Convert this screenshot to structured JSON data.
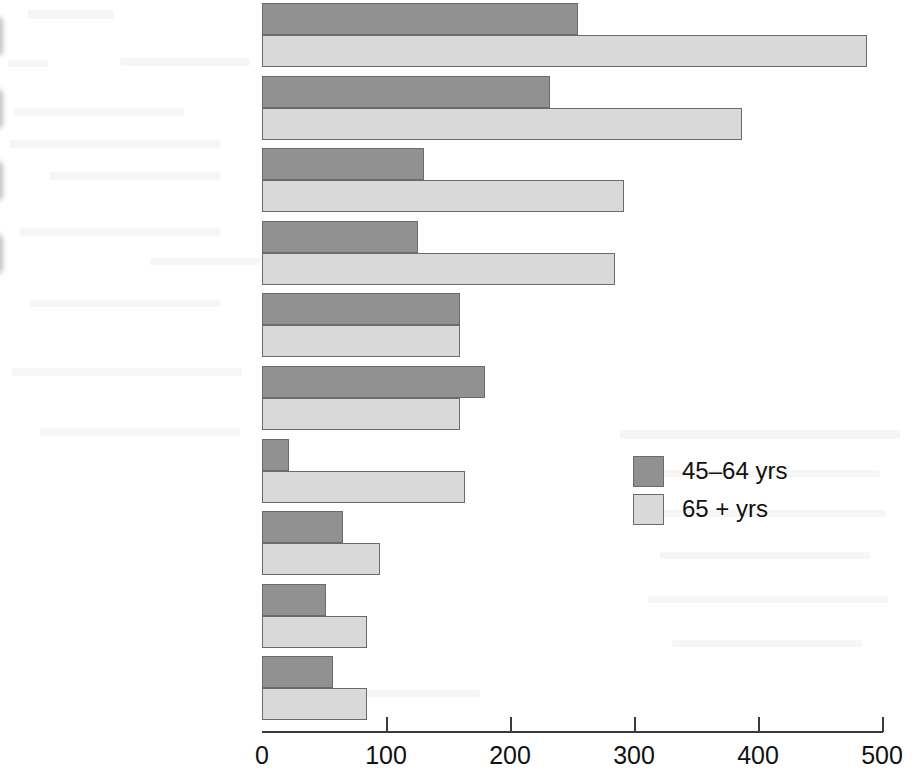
{
  "chart_data": {
    "type": "bar",
    "orientation": "horizontal",
    "title": "",
    "xlabel": "",
    "ylabel": "",
    "xlim": [
      0,
      500
    ],
    "xticks": [
      0,
      100,
      200,
      300,
      400,
      500
    ],
    "xtick_labels": [
      "0",
      "100",
      "200",
      "300",
      "400",
      "500"
    ],
    "grid": false,
    "legend_position": "center-right",
    "categories": [
      "Arthritis",
      "Hypertension",
      "Hearing impairment",
      "Heart disease",
      "Orthopedic impairment",
      "Sinusitis",
      "Cataracts",
      "Diabetes",
      "Visual impairment",
      "Tinnitus"
    ],
    "series": [
      {
        "name": "45–64 yrs",
        "color": "#919191",
        "values": [
          255,
          232,
          131,
          126,
          160,
          180,
          22,
          65,
          52,
          57
        ]
      },
      {
        "name": "65 + yrs",
        "color": "#d9d9d9",
        "values": [
          488,
          387,
          292,
          285,
          160,
          160,
          164,
          95,
          85,
          85
        ]
      }
    ],
    "highlighted_categories": [
      "Arthritis",
      "Hypertension",
      "Hearing impairment",
      "Heart disease"
    ]
  },
  "legend": {
    "items": [
      {
        "label": "45–64 yrs",
        "swatch": "dark"
      },
      {
        "label": "65 + yrs",
        "swatch": "light"
      }
    ]
  },
  "colors": {
    "series_45_64": "#919191",
    "series_65_plus": "#d9d9d9",
    "bar_outline": "#6b6b6b",
    "axis": "#3b3b3b",
    "highlight": "#b9b9b9",
    "background": "#ffffff"
  }
}
